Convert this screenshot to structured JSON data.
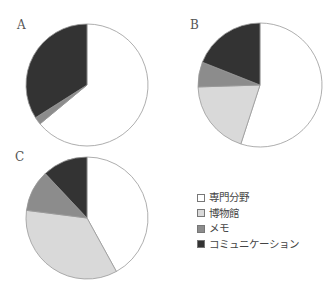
{
  "chart_data": [
    {
      "type": "pie",
      "title": "A",
      "categories": [
        "専門分野",
        "博物館",
        "メモ",
        "コミュニケーション"
      ],
      "values": [
        64,
        0,
        2,
        34
      ]
    },
    {
      "type": "pie",
      "title": "B",
      "categories": [
        "専門分野",
        "博物館",
        "メモ",
        "コミュニケーション"
      ],
      "values": [
        55,
        19.5,
        6.5,
        19
      ]
    },
    {
      "type": "pie",
      "title": "C",
      "categories": [
        "専門分野",
        "博物館",
        "メモ",
        "コミュニケーション"
      ],
      "values": [
        42,
        35,
        11,
        12
      ]
    }
  ],
  "colors": [
    "#ffffff",
    "#d9d9d9",
    "#8c8c8c",
    "#333333"
  ],
  "legend": {
    "items": [
      {
        "label": "専門分野",
        "color": "#ffffff"
      },
      {
        "label": "博物館",
        "color": "#d9d9d9"
      },
      {
        "label": "メモ",
        "color": "#8c8c8c"
      },
      {
        "label": "コミュニケーション",
        "color": "#333333"
      }
    ]
  },
  "panels": {
    "a": "A",
    "b": "B",
    "c": "C"
  }
}
